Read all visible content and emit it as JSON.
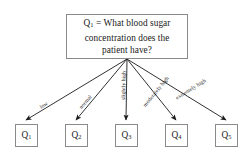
{
  "diagram": {
    "type": "decision-tree",
    "background_color": "#ffffff",
    "line_color": "#1a1a1a",
    "box_border_color": "#8a8a8a",
    "text_color": "#1a1a1a",
    "root": {
      "id": "Q1",
      "label_prefix": "Q",
      "label_subscript": "1",
      "equals": "=",
      "question": "What blood sugar concentration does the patient have?",
      "line1": "= What blood sugar",
      "line2": "concentration does the",
      "line3": "patient have?"
    },
    "edges": [
      {
        "label": "low",
        "target": "Q1"
      },
      {
        "label": "normal",
        "target": "Q2"
      },
      {
        "label": "slightly high",
        "target": "Q3"
      },
      {
        "label": "moderately high",
        "target": "Q4"
      },
      {
        "label": "extremely high",
        "target": "Q5"
      }
    ],
    "leaves": [
      {
        "label_prefix": "Q",
        "label_subscript": "1"
      },
      {
        "label_prefix": "Q",
        "label_subscript": "2"
      },
      {
        "label_prefix": "Q",
        "label_subscript": "3"
      },
      {
        "label_prefix": "Q",
        "label_subscript": "4"
      },
      {
        "label_prefix": "Q",
        "label_subscript": "5"
      }
    ]
  }
}
